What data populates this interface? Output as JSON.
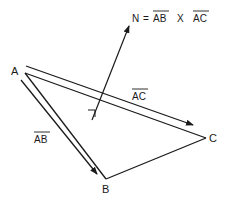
{
  "diagram": {
    "colors": {
      "stroke": "#1a1a1a",
      "background": "#ffffff"
    },
    "vertices": {
      "A": {
        "label": "A",
        "x": 24,
        "y": 71
      },
      "B": {
        "label": "B",
        "x": 106,
        "y": 179
      },
      "C": {
        "label": "C",
        "x": 206,
        "y": 138
      }
    },
    "vectors": {
      "ab": {
        "label": "AB",
        "overline": true
      },
      "ac": {
        "label": "AC",
        "overline": true
      },
      "normal": {
        "label": "N"
      }
    },
    "equation": {
      "lhs": "N",
      "eq": "=",
      "term1": "AB",
      "op": "X",
      "term2": "AC"
    },
    "right_angle_marker": true
  }
}
